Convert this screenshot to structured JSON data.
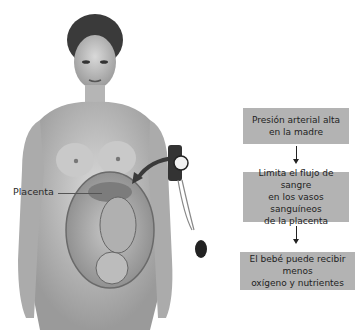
{
  "figure": {
    "label": "Placenta"
  },
  "flowchart": {
    "steps": [
      {
        "lines": [
          "Presión arterial alta",
          "en la madre"
        ]
      },
      {
        "lines": [
          "Limita el flujo de sangre",
          "en los vasos sanguíneos",
          "de la placenta"
        ]
      },
      {
        "lines": [
          "El bebé puede recibir menos",
          "oxígeno y nutrientes"
        ]
      }
    ],
    "box_color": "#b3b3b3"
  }
}
